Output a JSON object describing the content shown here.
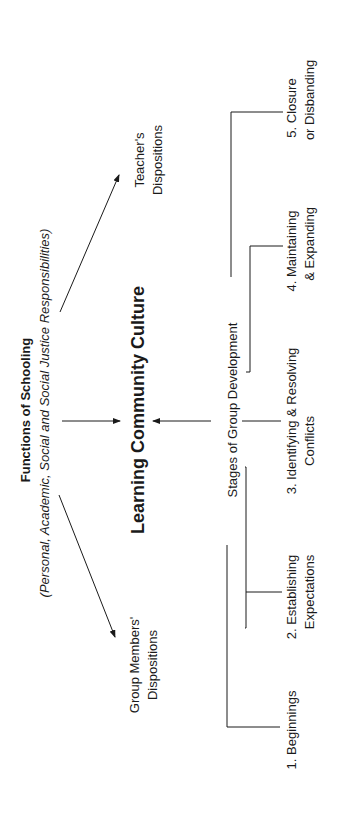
{
  "diagram": {
    "orientation": "rotated 90 degrees counter-clockwise",
    "top": {
      "title": "Functions of Schooling",
      "subtitle": "(Personal, Academic, Social and Social Justice Responsibilities)"
    },
    "center": {
      "title": "Learning Community Culture"
    },
    "left_node": {
      "line1": "Group Members'",
      "line2": "Dispositions"
    },
    "right_node": {
      "line1": "Teacher's",
      "line2": "Dispositions"
    },
    "stages": {
      "title": "Stages of Group Development",
      "items": [
        {
          "line1": "1. Beginnings",
          "line2": ""
        },
        {
          "line1": "2.  Establishing",
          "line2": "Expectations"
        },
        {
          "line1": "3.  Identifying & Resolving",
          "line2": "Conflicts"
        },
        {
          "line1": "4.  Maintaining",
          "line2": "& Expanding"
        },
        {
          "line1": "5.  Closure",
          "line2": "or Disbanding"
        }
      ]
    }
  }
}
